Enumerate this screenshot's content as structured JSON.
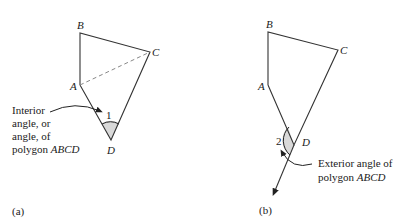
{
  "panel_a": {
    "caption": "(a)",
    "vertices": {
      "A": "A",
      "B": "B",
      "C": "C",
      "D": "D"
    },
    "angle_number": "1",
    "annotation": {
      "line1": "Interior",
      "line2": "angle, or",
      "line3": "angle, of",
      "line4_prefix": "polygon ",
      "line4_name": "ABCD"
    },
    "colors": {
      "stroke": "#333333",
      "shade": "#d9d9d9",
      "dashed": "#888888"
    }
  },
  "panel_b": {
    "caption": "(b)",
    "vertices": {
      "A": "A",
      "B": "B",
      "C": "C",
      "D": "D"
    },
    "angle_number": "2",
    "annotation": {
      "line1": "Exterior angle of",
      "line2_prefix": "polygon ",
      "line2_name": "ABCD"
    },
    "colors": {
      "stroke": "#333333",
      "shade": "#d9d9d9"
    }
  }
}
